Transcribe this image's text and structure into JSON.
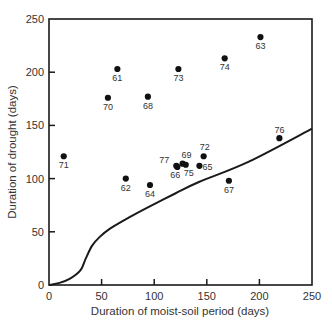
{
  "chart_data": {
    "type": "scatter",
    "title": "",
    "xlabel": "Duration of moist-soil period (days)",
    "ylabel": "Duration of drought (days)",
    "xlim": [
      0,
      250
    ],
    "ylim": [
      0,
      250
    ],
    "xticks": [
      0,
      50,
      100,
      150,
      200,
      250
    ],
    "yticks": [
      0,
      50,
      100,
      150,
      200,
      250
    ],
    "grid": false,
    "legend": null,
    "points": [
      {
        "label": "71",
        "x": 14,
        "y": 121
      },
      {
        "label": "61",
        "x": 65,
        "y": 203
      },
      {
        "label": "70",
        "x": 56,
        "y": 176
      },
      {
        "label": "68",
        "x": 94,
        "y": 177
      },
      {
        "label": "73",
        "x": 123,
        "y": 203
      },
      {
        "label": "74",
        "x": 167,
        "y": 213
      },
      {
        "label": "63",
        "x": 201,
        "y": 233
      },
      {
        "label": "62",
        "x": 73,
        "y": 100
      },
      {
        "label": "64",
        "x": 96,
        "y": 94
      },
      {
        "label": "77",
        "x": 121,
        "y": 112
      },
      {
        "label": "66",
        "x": 122,
        "y": 111
      },
      {
        "label": "69",
        "x": 127,
        "y": 114
      },
      {
        "label": "75",
        "x": 130,
        "y": 113
      },
      {
        "label": "65",
        "x": 143,
        "y": 112
      },
      {
        "label": "72",
        "x": 147,
        "y": 121
      },
      {
        "label": "76",
        "x": 219,
        "y": 138
      },
      {
        "label": "67",
        "x": 171,
        "y": 98
      }
    ],
    "curve": {
      "name": "threshold curve",
      "x": [
        0,
        10,
        20,
        30,
        35,
        41,
        48,
        58,
        77,
        94,
        120,
        143,
        190,
        250
      ],
      "y": [
        0,
        2,
        6,
        14,
        25,
        37,
        45,
        53,
        64,
        73,
        86,
        97,
        116,
        147
      ]
    }
  }
}
